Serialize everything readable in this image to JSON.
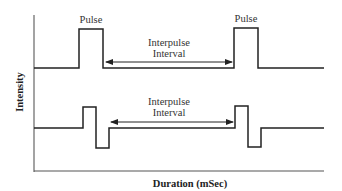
{
  "diagram": {
    "type": "pulse-waveform",
    "axes": {
      "y_label": "Intensity",
      "x_label": "Duration (mSec)"
    },
    "panels": [
      {
        "name": "monophasic",
        "pulse_labels": [
          "Pulse",
          "Pulse"
        ],
        "interval_label_line1": "Interpulse",
        "interval_label_line2": "Interval"
      },
      {
        "name": "biphasic",
        "interval_label_line1": "Interpulse",
        "interval_label_line2": "Interval"
      }
    ],
    "colors": {
      "line": "#222222",
      "axis": "#555555",
      "background": "#ffffff"
    }
  }
}
